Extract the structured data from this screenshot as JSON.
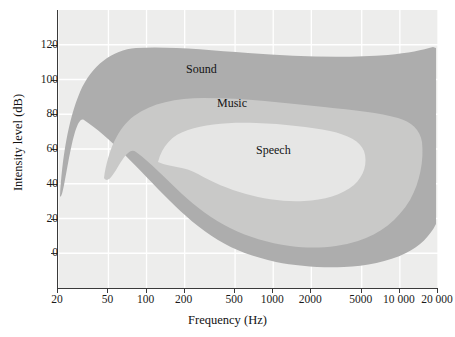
{
  "chart_data": {
    "type": "area",
    "title": "",
    "xlabel": "Frequency (Hz)",
    "ylabel": "Intensity level (dB)",
    "xscale": "log",
    "xlim": [
      20,
      20000
    ],
    "ylim": [
      -20,
      140
    ],
    "grid": true,
    "grid_color": "#ffffff",
    "plot_background": "#ededec",
    "xticks": [
      {
        "value": 20,
        "label": "20"
      },
      {
        "value": 50,
        "label": "50"
      },
      {
        "value": 100,
        "label": "100"
      },
      {
        "value": 200,
        "label": "200"
      },
      {
        "value": 500,
        "label": "500"
      },
      {
        "value": 1000,
        "label": "1000"
      },
      {
        "value": 2000,
        "label": "2000"
      },
      {
        "value": 5000,
        "label": "5000"
      },
      {
        "value": 10000,
        "label": "10 000"
      },
      {
        "value": 20000,
        "label": "20 000"
      }
    ],
    "yticks": [
      {
        "value": 0,
        "label": "0"
      },
      {
        "value": 20,
        "label": "20"
      },
      {
        "value": 40,
        "label": "40"
      },
      {
        "value": 60,
        "label": "60"
      },
      {
        "value": 80,
        "label": "80"
      },
      {
        "value": 100,
        "label": "100"
      },
      {
        "value": 120,
        "label": "120"
      }
    ],
    "regions": [
      {
        "name": "Sound",
        "label": "Sound",
        "color": "#adadad",
        "label_x_hz": 300,
        "label_y_db": 105,
        "description": "Full range of audible sound; outermost envelope spanning roughly 20 Hz to 20 000 Hz and about -10 dB to 133 dB."
      },
      {
        "name": "Music",
        "label": "Music",
        "color": "#c9c9c8",
        "label_x_hz": 600,
        "label_y_db": 85,
        "description": "Range of musical sounds; intermediate envelope roughly 60 Hz to 12 000 Hz and about 20 dB to 95 dB."
      },
      {
        "name": "Speech",
        "label": "Speech",
        "color": "#e6e6e5",
        "label_x_hz": 1100,
        "label_y_db": 62,
        "description": "Range of conversational speech; innermost envelope roughly 180 Hz to 8 000 Hz and about 38 dB to 75 dB."
      }
    ]
  },
  "axes": {
    "x_title": "Frequency (Hz)",
    "y_title": "Intensity level (dB)"
  }
}
